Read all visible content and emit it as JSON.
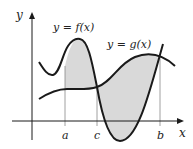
{
  "diagram": {
    "axes": {
      "x_label": "x",
      "y_label": "y"
    },
    "curves": [
      {
        "name": "f",
        "label": "y = f(x)"
      },
      {
        "name": "g",
        "label": "y = g(x)"
      }
    ],
    "ticks": [
      {
        "label": "a"
      },
      {
        "label": "c"
      },
      {
        "label": "b"
      }
    ],
    "colors": {
      "stroke": "#1a1a1a",
      "shade": "#d9d9d9",
      "guide": "#888888"
    }
  }
}
